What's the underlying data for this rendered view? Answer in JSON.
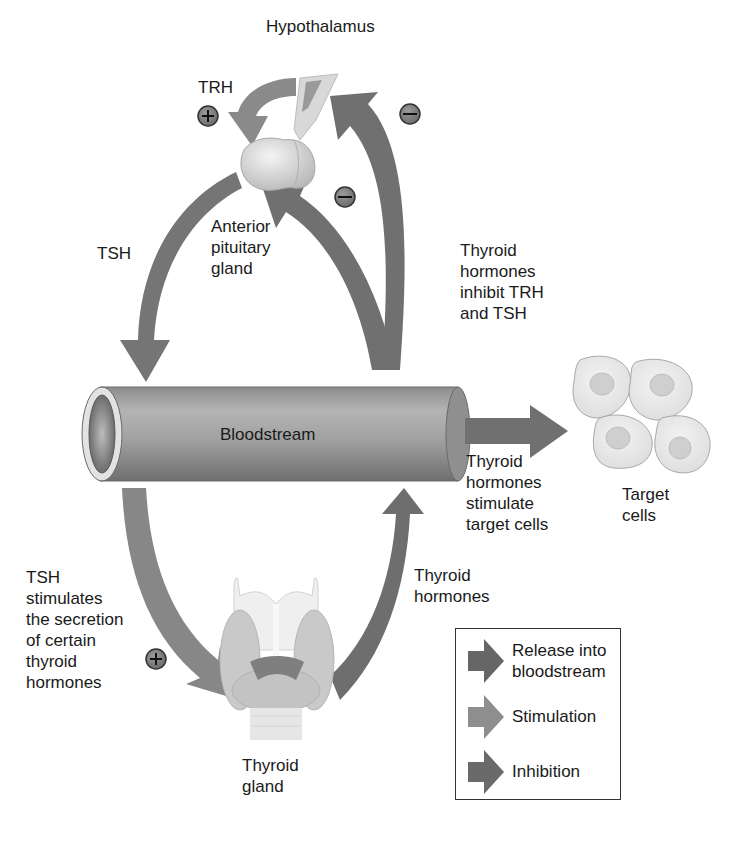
{
  "colors": {
    "arrow_release": "#6e6e6e",
    "arrow_stimulation": "#8a8a8a",
    "arrow_inhibition": "#6a6a6a",
    "vessel": "#9a9a9a",
    "background": "#ffffff"
  },
  "structures": {
    "hypothalamus": "Hypothalamus",
    "anterior_pituitary": "Anterior\npituitary\ngland",
    "bloodstream": "Bloodstream",
    "thyroid_gland": "Thyroid\ngland",
    "target_cells": "Target\ncells"
  },
  "labels": {
    "trh": "TRH",
    "tsh_top": "TSH",
    "inhibit": "Thyroid\nhormones\ninhibit TRH\nand TSH",
    "stimulate_targets": "Thyroid\nhormones\nstimulate\ntarget cells",
    "tsh_stimulates": "TSH\nstimulates\nthe secretion\nof certain\nthyroid\nhormones",
    "thyroid_hormones": "Thyroid\nhormones"
  },
  "signs": {
    "trh_sign": "+",
    "hypothalamus_inhibit_sign": "−",
    "pituitary_inhibit_sign": "−",
    "tsh_thyroid_sign": "+"
  },
  "legend": {
    "items": [
      {
        "label": "Release into\nbloodstream",
        "type": "release"
      },
      {
        "label": "Stimulation",
        "type": "stimulation"
      },
      {
        "label": "Inhibition",
        "type": "inhibition"
      }
    ]
  }
}
